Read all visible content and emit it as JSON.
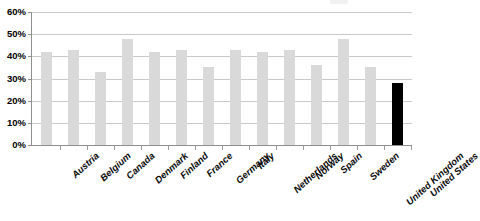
{
  "chart_data": {
    "type": "bar",
    "title": "",
    "xlabel": "",
    "ylabel": "",
    "ylim": [
      0,
      60
    ],
    "ytick_labels": [
      "60%",
      "50%",
      "40%",
      "30%",
      "20%",
      "10%",
      "0%"
    ],
    "ytick_values": [
      60,
      50,
      40,
      30,
      20,
      10,
      0
    ],
    "grid": true,
    "legend": "none",
    "categories": [
      "Austria",
      "Belgium",
      "Canada",
      "Denmark",
      "Finland",
      "France",
      "Germany",
      "Italy",
      "Netherlands",
      "Norway",
      "Spain",
      "Sweden",
      "United Kingdom",
      "United States"
    ],
    "values": [
      42,
      43,
      33,
      48,
      42,
      43,
      35,
      43,
      42,
      43,
      36,
      48,
      35,
      28
    ],
    "series": [
      {
        "name": "Share",
        "values": [
          42,
          43,
          33,
          48,
          42,
          43,
          35,
          43,
          42,
          43,
          36,
          48,
          35,
          28
        ]
      }
    ],
    "bar_colors": [
      "#d9d9d9",
      "#d9d9d9",
      "#d9d9d9",
      "#d9d9d9",
      "#d9d9d9",
      "#d9d9d9",
      "#d9d9d9",
      "#d9d9d9",
      "#d9d9d9",
      "#d9d9d9",
      "#d9d9d9",
      "#d9d9d9",
      "#d9d9d9",
      "#000000"
    ],
    "highlight_category": "United States",
    "colors": {
      "bar_default": "#d9d9d9",
      "bar_highlight": "#000000",
      "gridline": "#c9c9c9",
      "axis": "#8f8f8f",
      "text": "#000000",
      "background": "#ffffff"
    }
  }
}
